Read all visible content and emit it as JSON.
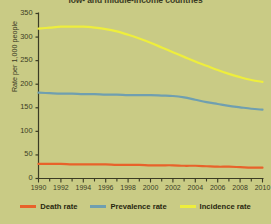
{
  "chart_data": {
    "type": "line",
    "title": "low- and middle-income countries",
    "xlabel": "",
    "ylabel": "Rate per 1,000 people",
    "xlim": [
      1990,
      2010
    ],
    "ylim": [
      0,
      350
    ],
    "ytick_labels": [
      "0",
      "50",
      "100",
      "150",
      "200",
      "250",
      "300",
      "350"
    ],
    "ytick_values": [
      0,
      50,
      100,
      150,
      200,
      250,
      300,
      350
    ],
    "xtick_labels": [
      "1990",
      "1992",
      "1994",
      "1996",
      "1998",
      "2000",
      "2002",
      "2004",
      "2006",
      "2008",
      "2010"
    ],
    "xtick_values": [
      1990,
      1992,
      1994,
      1996,
      1998,
      2000,
      2002,
      2004,
      2006,
      2008,
      2010
    ],
    "x": [
      1990,
      1991,
      1992,
      1993,
      1994,
      1995,
      1996,
      1997,
      1998,
      1999,
      2000,
      2001,
      2002,
      2003,
      2004,
      2005,
      2006,
      2007,
      2008,
      2009,
      2010
    ],
    "grid": false,
    "legend_position": "bottom",
    "series": [
      {
        "name": "Death rate",
        "color": "#e8622a",
        "values": [
          31,
          31,
          31,
          30,
          30,
          30,
          30,
          29,
          29,
          29,
          28,
          28,
          28,
          27,
          27,
          26,
          25,
          25,
          24,
          23,
          23
        ]
      },
      {
        "name": "Prevalence rate",
        "color": "#6f9fb0",
        "values": [
          182,
          181,
          180,
          180,
          179,
          179,
          178,
          178,
          177,
          177,
          177,
          176,
          175,
          172,
          167,
          162,
          158,
          154,
          151,
          148,
          146
        ]
      },
      {
        "name": "Incidence rate",
        "color": "#eeee3c",
        "values": [
          318,
          320,
          322,
          322,
          322,
          320,
          317,
          312,
          305,
          297,
          288,
          278,
          268,
          258,
          248,
          239,
          230,
          222,
          215,
          209,
          205
        ]
      }
    ]
  },
  "legend": {
    "items": [
      {
        "label": "Death rate",
        "color": "#e8622a"
      },
      {
        "label": "Prevalence rate",
        "color": "#6f9fb0"
      },
      {
        "label": "Incidence rate",
        "color": "#eeee3c"
      }
    ]
  },
  "colors": {
    "background": "#c9cb85",
    "axis": "#3b3b24",
    "text": "#3b3b24"
  }
}
